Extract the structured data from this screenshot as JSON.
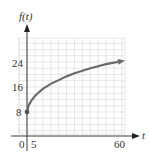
{
  "chart_data": {
    "type": "line",
    "title": "",
    "xlabel": "t",
    "ylabel": "f(t)",
    "x_ticks_labeled": [
      0,
      5,
      60
    ],
    "y_ticks_labeled": [
      8,
      16,
      24
    ],
    "xlim": [
      -5,
      62
    ],
    "ylim": [
      0,
      30
    ],
    "grid": true,
    "grid_x_step": 5,
    "grid_y_step": 2,
    "series": [
      {
        "name": "f(t)",
        "x": [
          0,
          1,
          2,
          3,
          5,
          7.5,
          10,
          15,
          20,
          25,
          30,
          40,
          50,
          60
        ],
        "values": [
          8,
          10,
          11,
          11.8,
          13.1,
          14.3,
          15.4,
          17,
          18.2,
          19.4,
          20.4,
          22,
          23.3,
          24.3
        ],
        "start_point_marker": true,
        "end_arrow": true
      }
    ],
    "colors": {
      "curve": "#6b6b6b",
      "grid": "#d8d8d8",
      "axis": "#222222"
    }
  },
  "labels": {
    "y_axis": "f(t)",
    "x_axis": "t",
    "y_ticks": [
      "8",
      "16",
      "24"
    ],
    "x_ticks": [
      "0",
      "5",
      "60"
    ]
  }
}
